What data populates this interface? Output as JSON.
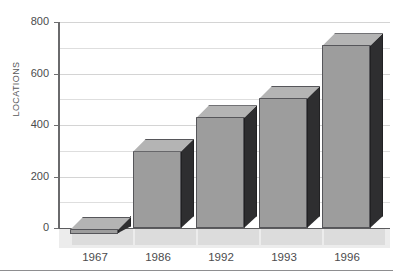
{
  "chart_data": {
    "type": "bar",
    "title": "",
    "xlabel": "",
    "ylabel": "LOCATIONS",
    "categories": [
      "1967",
      "1986",
      "1992",
      "1993",
      "1996"
    ],
    "values": [
      10,
      300,
      430,
      505,
      710
    ],
    "ylim": [
      0,
      800
    ],
    "ytick_labels": [
      "0",
      "200",
      "400",
      "600",
      "800"
    ],
    "ytick_values": [
      0,
      200,
      400,
      600,
      800
    ],
    "gridline_values": [
      100,
      200,
      300,
      400,
      500,
      600,
      700,
      800
    ],
    "grid": true,
    "legend": false,
    "legend_position": "none",
    "style_3d": true,
    "colors": {
      "bar_front": "#9d9d9d",
      "bar_top": "#b4b4b4",
      "bar_side": "#2e2e30",
      "bar_edge": "#56565a",
      "gridline": "#dedede",
      "axis": "#6a6a6c",
      "text": "#4b4b4d",
      "floor": "#ececec",
      "footer_rule": "#8e8e90"
    }
  }
}
